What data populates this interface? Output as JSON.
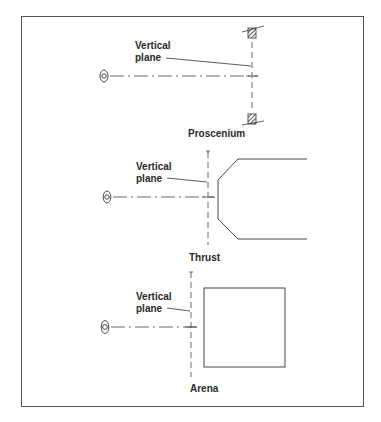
{
  "figure": {
    "panels": [
      {
        "id": "proscenium",
        "plane_label_line1": "Vertical",
        "plane_label_line2": "plane",
        "caption": "Proscenium"
      },
      {
        "id": "thrust",
        "plane_label_line1": "Vertical",
        "plane_label_line2": "plane",
        "caption": "Thrust"
      },
      {
        "id": "arena",
        "plane_label_line1": "Vertical",
        "plane_label_line2": "plane",
        "caption": "Arena"
      }
    ],
    "icons": [
      "eye-viewer-icon",
      "hatched-wall-icon"
    ],
    "colors": {
      "line": "#3a3a3a",
      "frame": "#555555",
      "background": "#ffffff"
    }
  }
}
